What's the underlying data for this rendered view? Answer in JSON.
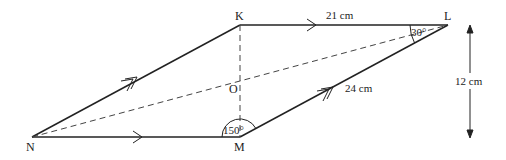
{
  "diagram": {
    "type": "parallelogram",
    "vertices": {
      "K": {
        "label": "K",
        "x": 240,
        "y": 25
      },
      "L": {
        "label": "L",
        "x": 448,
        "y": 25
      },
      "M": {
        "label": "M",
        "x": 240,
        "y": 137
      },
      "N": {
        "label": "N",
        "x": 32,
        "y": 137
      }
    },
    "intersection": {
      "label": "O"
    },
    "measurements": {
      "KL": "21 cm",
      "ML": "24 cm",
      "height": "12 cm"
    },
    "angles": {
      "L": "30°",
      "M": "150°"
    },
    "colors": {
      "line": "#222222",
      "background": "#ffffff"
    }
  }
}
